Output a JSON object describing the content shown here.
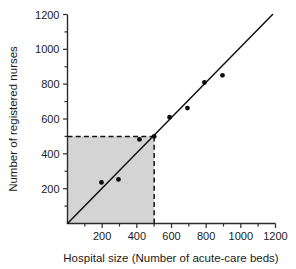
{
  "chart_data": {
    "type": "scatter",
    "title": "",
    "xlabel": "Hospital size (Number of acute-care beds)",
    "ylabel": "Number of registered nurses",
    "xlim": [
      0,
      1200
    ],
    "ylim": [
      0,
      1200
    ],
    "xticks": [
      0,
      200,
      400,
      600,
      800,
      1000,
      1200
    ],
    "yticks": [
      0,
      200,
      400,
      600,
      800,
      1000,
      1200
    ],
    "xtick_labels": [
      "",
      "200",
      "400",
      "600",
      "800",
      "1000",
      "1200"
    ],
    "ytick_labels": [
      "",
      "200",
      "400",
      "600",
      "800",
      "1000",
      "1200"
    ],
    "minor_xticks": [
      100,
      300,
      500,
      700,
      900,
      1100
    ],
    "minor_yticks": [
      100,
      300,
      500,
      700,
      900,
      1100
    ],
    "grid": false,
    "legend": false,
    "series": [
      {
        "name": "Hospitals",
        "marker": "filled-circle",
        "color": "#0d0d0d",
        "points": [
          {
            "x": 196,
            "y": 236
          },
          {
            "x": 294,
            "y": 253
          },
          {
            "x": 415,
            "y": 483
          },
          {
            "x": 500,
            "y": 500
          },
          {
            "x": 589,
            "y": 610
          },
          {
            "x": 692,
            "y": 663
          },
          {
            "x": 790,
            "y": 810
          },
          {
            "x": 894,
            "y": 851
          }
        ]
      }
    ],
    "fit_line": {
      "name": "Least-squares regression line",
      "color": "#111111",
      "x_start": 0,
      "y_start": 0,
      "x_end": 1183,
      "y_end": 1200
    },
    "annotations": {
      "shaded_rectangle": {
        "x_from": 0,
        "x_to": 500,
        "y_from": 0,
        "y_to": 500,
        "color": "#d4d4d4"
      },
      "guide_lines": [
        {
          "orientation": "horizontal",
          "value": 500,
          "from": 0,
          "to": 500,
          "style": "dashed"
        },
        {
          "orientation": "vertical",
          "value": 500,
          "from": 0,
          "to": 500,
          "style": "dashed"
        }
      ]
    }
  }
}
